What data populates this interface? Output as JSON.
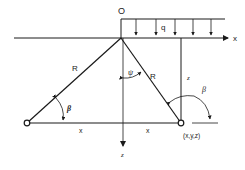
{
  "diagram": {
    "type": "geometry-load-diagram",
    "colors": {
      "stroke": "#1a1a1a",
      "background": "#ffffff"
    },
    "labels": {
      "origin": "O",
      "load": "q",
      "x_axis": "x",
      "z_axis": "z",
      "depth_z": "z",
      "radius_left": "R",
      "radius_right": "R",
      "angle_psi": "ψ",
      "angle_beta_left": "β",
      "angle_beta_right": "β",
      "dist_left": "x",
      "dist_right": "x",
      "point": "(x,y,z)"
    }
  }
}
